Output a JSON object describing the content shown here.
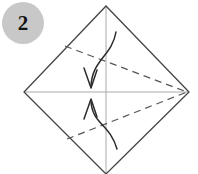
{
  "figure": {
    "kind": "origami-fold-step-diagram",
    "width": 198,
    "height": 174,
    "background_color": "#ffffff"
  },
  "step_badge": {
    "number": "2",
    "circle_color": "#c8c8c8",
    "text_color": "#141414"
  },
  "colors": {
    "outline": "#444444",
    "crease_dashed": "#555555",
    "center_guide": "#aaaaaa",
    "arrow": "#2b2b2b"
  },
  "geometry": {
    "diamond": {
      "label": "square-rotated-45",
      "top": [
        106,
        6
      ],
      "right": [
        189,
        92
      ],
      "bottom": [
        106,
        174
      ],
      "left": [
        24,
        92
      ],
      "stroke_width": 1.3
    },
    "center_guides": {
      "vertical": {
        "x": 106,
        "y1": 6,
        "y2": 174
      },
      "horizontal": {
        "y": 92,
        "x1": 25,
        "x2": 188
      }
    },
    "valley_creases": [
      {
        "name": "upper-crease",
        "from": [
          65,
          46
        ],
        "to": [
          187,
          92
        ],
        "dash": "7,5"
      },
      {
        "name": "lower-crease",
        "from": [
          67,
          139
        ],
        "to": [
          187,
          92
        ],
        "dash": "7,5"
      }
    ],
    "fold_arrows": [
      {
        "name": "upper-fold-arrow",
        "direction": "down",
        "start": [
          116,
          32
        ],
        "control1": [
          112,
          56
        ],
        "control2": [
          92,
          60
        ],
        "end": [
          91,
          86
        ],
        "head_tip": [
          91,
          88
        ]
      },
      {
        "name": "lower-fold-arrow",
        "direction": "up",
        "start": [
          117,
          149
        ],
        "control1": [
          110,
          124
        ],
        "control2": [
          92,
          124
        ],
        "end": [
          91,
          101
        ],
        "head_tip": [
          91,
          99
        ]
      }
    ]
  }
}
